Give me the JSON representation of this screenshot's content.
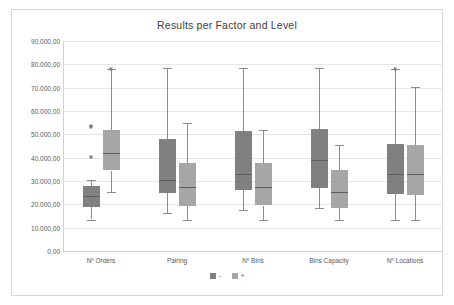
{
  "chart_data": {
    "type": "box",
    "title": "Results per Factor and Level",
    "xlabel": "",
    "ylabel": "",
    "ylim": [
      0,
      90000
    ],
    "ytick_step": 10000,
    "grid": true,
    "legend_position": "bottom",
    "y_tick_labels": [
      "90.000,00",
      "80.000,00",
      "70.000,00",
      "60.000,00",
      "50.000,00",
      "40.000,00",
      "30.000,00",
      "20.000,00",
      "10.000,00",
      "0,00"
    ],
    "y_tick_values": [
      90000,
      80000,
      70000,
      60000,
      50000,
      40000,
      30000,
      20000,
      10000,
      0
    ],
    "categories": [
      "Nº Orders",
      "Pairing",
      "Nº Bins",
      "Bins Capacity",
      "Nº Locations"
    ],
    "legend": [
      {
        "name": "-",
        "color": "#808080"
      },
      {
        "name": "+",
        "color": "#a6a6a6"
      }
    ],
    "series": [
      {
        "name": "-",
        "color": "#808080",
        "boxes": [
          {
            "category": "Nº Orders",
            "whisker_low": 13500,
            "q1": 19000,
            "median": 23500,
            "q3": 27800,
            "whisker_high": 30500,
            "outliers": [
              40200,
              53000,
              53600
            ]
          },
          {
            "category": "Pairing",
            "whisker_low": 16200,
            "q1": 24900,
            "median": 30300,
            "q3": 48000,
            "whisker_high": 78500,
            "outliers": []
          },
          {
            "category": "Nº Bins",
            "whisker_low": 17500,
            "q1": 26200,
            "median": 33000,
            "q3": 51500,
            "whisker_high": 78500,
            "outliers": []
          },
          {
            "category": "Bins Capacity",
            "whisker_low": 18600,
            "q1": 27100,
            "median": 39000,
            "q3": 52200,
            "whisker_high": 78500,
            "outliers": []
          },
          {
            "category": "Nº Locations",
            "whisker_low": 13300,
            "q1": 24300,
            "median": 33000,
            "q3": 45700,
            "whisker_high": 78000,
            "outliers": [
              78200
            ]
          }
        ]
      },
      {
        "name": "+",
        "color": "#a6a6a6",
        "boxes": [
          {
            "category": "Nº Orders",
            "whisker_low": 25300,
            "q1": 34500,
            "median": 42000,
            "q3": 51900,
            "whisker_high": 78000,
            "outliers": [
              78200
            ]
          },
          {
            "category": "Pairing",
            "whisker_low": 13300,
            "q1": 19400,
            "median": 27500,
            "q3": 37900,
            "whisker_high": 54700,
            "outliers": []
          },
          {
            "category": "Nº Bins",
            "whisker_low": 13300,
            "q1": 19500,
            "median": 27500,
            "q3": 37700,
            "whisker_high": 51800,
            "outliers": []
          },
          {
            "category": "Bins Capacity",
            "whisker_low": 13400,
            "q1": 18500,
            "median": 25500,
            "q3": 34700,
            "whisker_high": 45400,
            "outliers": []
          },
          {
            "category": "Nº Locations",
            "whisker_low": 13300,
            "q1": 24200,
            "median": 33000,
            "q3": 45600,
            "whisker_high": 70400,
            "outliers": []
          }
        ]
      }
    ]
  }
}
